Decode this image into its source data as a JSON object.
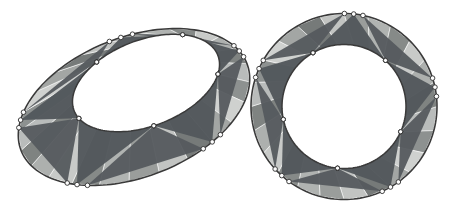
{
  "figure": {
    "background_color": "#ffffff",
    "outline_color": "#3a3a3a",
    "vertex_marker_color": "#fdfdfd",
    "vertex_marker_stroke": "#2e2e2e",
    "shapes": [
      {
        "id": "left-ellipse-annulus",
        "name": "elliptical-annulus",
        "projection": "oblique",
        "outer": {
          "cx": 134.0,
          "cy": 107.0,
          "rx": 121.0,
          "ry": 70.0,
          "rotation_deg": -21.0
        },
        "inner": {
          "cx": 146.0,
          "cy": 83.0,
          "rx": 77.0,
          "ry": 43.0,
          "rotation_deg": -21.0
        },
        "segments": 24,
        "star_points": 5,
        "star_offset_deg": 6
      },
      {
        "id": "right-circle-annulus",
        "name": "circular-annulus",
        "projection": "frontal",
        "outer": {
          "cx": 344.0,
          "cy": 106.5,
          "rx": 93.0,
          "ry": 93.0,
          "rotation_deg": 0.0
        },
        "inner": {
          "cx": 344.0,
          "cy": 106.5,
          "rx": 62.0,
          "ry": 62.0,
          "rotation_deg": 0.0
        },
        "segments": 24,
        "star_points": 5,
        "star_offset_deg": 6
      }
    ],
    "palette": {
      "dark": "#555a5e",
      "star": "#53585c",
      "tones": [
        "#b9bcbb",
        "#8d9190",
        "#cfd1cf",
        "#a3a6a4",
        "#767a79",
        "#c2c4c2",
        "#9a9d9b",
        "#b0b3b1",
        "#868a88",
        "#c8cac8",
        "#adb0ae",
        "#7f8381"
      ]
    },
    "labels": {
      "left_shape_label": "projected annulus",
      "right_shape_label": "circular annulus"
    }
  }
}
